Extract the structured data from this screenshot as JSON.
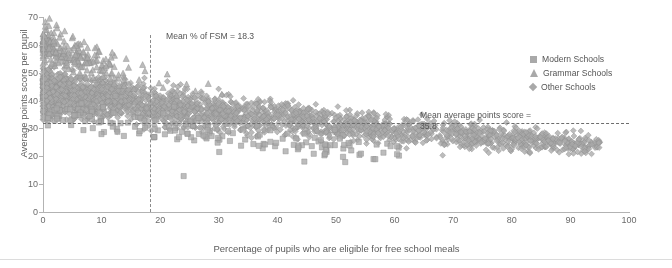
{
  "chart_data": {
    "type": "scatter",
    "title": "",
    "xlabel": "Percentage of pupils who are eligible for free school meals",
    "ylabel": "Average points score per pupil",
    "xlim": [
      0,
      100
    ],
    "ylim": [
      0,
      70
    ],
    "xticks": [
      0,
      10,
      20,
      30,
      40,
      50,
      60,
      70,
      80,
      90,
      100
    ],
    "yticks": [
      0,
      10,
      20,
      30,
      40,
      50,
      60,
      70
    ],
    "grid": false,
    "legend_position": "right",
    "series": [
      {
        "name": "Modern Schools",
        "marker": "square",
        "color": "#a9a9a9",
        "points": [
          [
            2.1,
            36.5
          ],
          [
            3.4,
            33.0
          ],
          [
            4.8,
            31.2
          ],
          [
            5.6,
            34.8
          ],
          [
            6.9,
            29.4
          ],
          [
            7.2,
            32.6
          ],
          [
            8.5,
            30.1
          ],
          [
            9.8,
            33.5
          ],
          [
            10.4,
            28.7
          ],
          [
            11.9,
            31.8
          ],
          [
            12.6,
            29.9
          ],
          [
            13.8,
            27.3
          ],
          [
            14.5,
            32.1
          ],
          [
            15.7,
            30.6
          ],
          [
            16.4,
            28.2
          ],
          [
            17.8,
            31.0
          ],
          [
            18.9,
            26.8
          ],
          [
            19.6,
            29.3
          ],
          [
            20.8,
            27.9
          ],
          [
            21.5,
            30.4
          ],
          [
            22.9,
            26.1
          ],
          [
            23.7,
            28.8
          ],
          [
            24.4,
            31.5
          ],
          [
            25.8,
            25.7
          ],
          [
            26.6,
            28.0
          ],
          [
            27.9,
            26.4
          ],
          [
            28.5,
            29.1
          ],
          [
            29.8,
            24.9
          ],
          [
            30.6,
            27.2
          ],
          [
            31.9,
            25.5
          ],
          [
            32.4,
            28.3
          ],
          [
            33.8,
            23.8
          ],
          [
            34.5,
            26.0
          ],
          [
            35.9,
            24.4
          ],
          [
            36.7,
            27.1
          ],
          [
            37.5,
            22.9
          ],
          [
            38.8,
            25.2
          ],
          [
            39.6,
            23.6
          ],
          [
            40.9,
            26.3
          ],
          [
            41.4,
            21.8
          ],
          [
            42.8,
            24.1
          ],
          [
            43.5,
            22.5
          ],
          [
            44.9,
            25.0
          ],
          [
            46.2,
            20.9
          ],
          [
            47.6,
            23.2
          ],
          [
            48.4,
            21.6
          ],
          [
            49.8,
            24.0
          ],
          [
            51.2,
            19.8
          ],
          [
            52.6,
            22.1
          ],
          [
            54.0,
            20.5
          ],
          [
            24.0,
            12.9
          ],
          [
            44.6,
            18.1
          ],
          [
            56.4,
            19.0
          ],
          [
            58.1,
            21.3
          ]
        ]
      },
      {
        "name": "Grammar Schools",
        "marker": "triangle",
        "color": "#a9a9a9",
        "points": [
          [
            0.4,
            68.2
          ],
          [
            0.6,
            65.4
          ],
          [
            0.8,
            63.1
          ],
          [
            1.0,
            66.8
          ],
          [
            1.2,
            61.5
          ],
          [
            1.4,
            64.2
          ],
          [
            1.6,
            59.8
          ],
          [
            1.8,
            62.6
          ],
          [
            2.0,
            57.4
          ],
          [
            2.2,
            60.9
          ],
          [
            2.4,
            66.0
          ],
          [
            2.6,
            55.2
          ],
          [
            2.8,
            58.7
          ],
          [
            3.0,
            63.8
          ],
          [
            3.2,
            53.9
          ],
          [
            3.4,
            57.0
          ],
          [
            3.6,
            61.2
          ],
          [
            3.8,
            52.6
          ],
          [
            4.0,
            55.8
          ],
          [
            4.2,
            59.4
          ],
          [
            4.4,
            51.3
          ],
          [
            4.6,
            54.5
          ],
          [
            4.8,
            58.0
          ],
          [
            5.0,
            62.4
          ],
          [
            5.2,
            50.1
          ],
          [
            5.5,
            53.2
          ],
          [
            5.8,
            56.6
          ],
          [
            6.1,
            60.3
          ],
          [
            6.4,
            49.0
          ],
          [
            6.8,
            52.0
          ],
          [
            7.2,
            55.4
          ],
          [
            7.6,
            58.9
          ],
          [
            8.0,
            47.8
          ],
          [
            8.5,
            51.0
          ],
          [
            9.0,
            54.2
          ],
          [
            9.6,
            57.5
          ],
          [
            10.2,
            46.6
          ],
          [
            10.8,
            49.8
          ],
          [
            11.5,
            53.0
          ],
          [
            12.2,
            56.1
          ],
          [
            13.0,
            45.4
          ],
          [
            13.8,
            48.6
          ],
          [
            14.6,
            51.8
          ],
          [
            15.5,
            44.2
          ],
          [
            16.4,
            47.4
          ],
          [
            17.4,
            50.6
          ],
          [
            18.5,
            43.0
          ],
          [
            19.8,
            46.2
          ],
          [
            21.2,
            49.4
          ],
          [
            22.8,
            41.8
          ],
          [
            1.1,
            69.4
          ],
          [
            2.3,
            67.1
          ],
          [
            3.7,
            64.9
          ],
          [
            5.1,
            63.0
          ],
          [
            7.0,
            61.0
          ],
          [
            9.2,
            59.2
          ],
          [
            11.8,
            57.2
          ],
          [
            14.2,
            55.0
          ],
          [
            17.0,
            52.8
          ],
          [
            20.5,
            44.6
          ],
          [
            24.5,
            45.8
          ],
          [
            26.0,
            43.4
          ],
          [
            28.2,
            46.0
          ],
          [
            30.5,
            42.2
          ]
        ]
      },
      {
        "name": "Other Schools",
        "marker": "diamond",
        "color": "#a9a9a9",
        "note": "Dominant group; ~2800 points forming dense negatively-sloped band from (0,55) tapering to (95,20)",
        "points_summary": {
          "count": 2800,
          "x_range": [
            0,
            95
          ],
          "y_range": [
            8,
            62
          ],
          "trend": "negative",
          "band_top_at_x0": 60,
          "band_bottom_at_x0": 26,
          "band_top_at_x60": 36,
          "band_bottom_at_x60": 14
        }
      }
    ],
    "annotations": [
      {
        "id": "mean-fsm",
        "text": "Mean % of FSM = 18.3",
        "value": 18.3,
        "orientation": "vertical",
        "line_style": "dash-dot"
      },
      {
        "id": "mean-aps",
        "text": "Mean average points score = 35.8",
        "text_line1": "Mean average points score =",
        "text_line2": "35.8",
        "value": 35.8,
        "line_value": 31.8,
        "orientation": "horizontal",
        "line_style": "dash-dot"
      }
    ]
  },
  "legend": {
    "items": [
      {
        "label": "Modern Schools",
        "marker": "square-marker"
      },
      {
        "label": "Grammar Schools",
        "marker": "triangle-marker"
      },
      {
        "label": "Other Schools",
        "marker": "diamond-marker"
      }
    ]
  },
  "colors": {
    "marker": "#a9a9a9",
    "marker_edge": "#8f8f8f",
    "axis": "#b3b3b3",
    "text": "#5a5a5a",
    "ref_line": "#6d6d6d"
  }
}
